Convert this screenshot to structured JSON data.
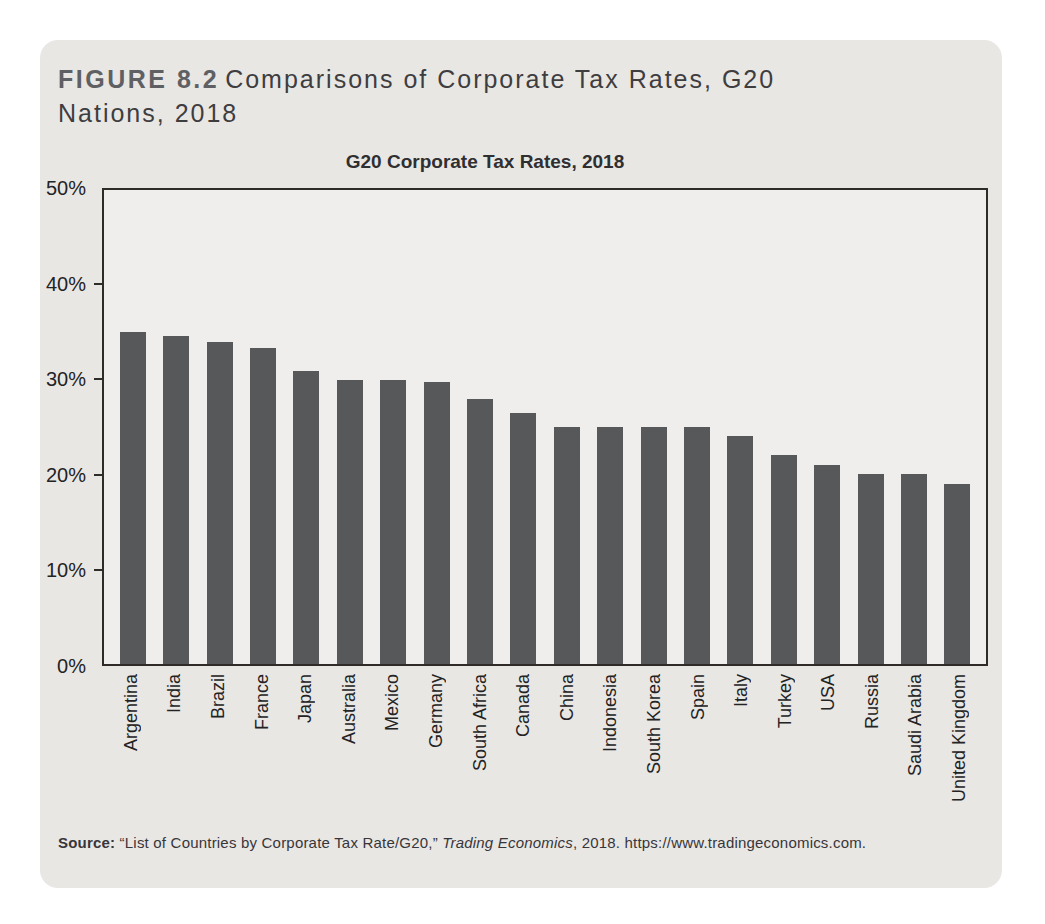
{
  "figure": {
    "label": "FIGURE 8.2",
    "title": "Comparisons of Corporate Tax Rates, G20 Nations, 2018"
  },
  "chart_data": {
    "type": "bar",
    "title": "G20 Corporate Tax Rates, 2018",
    "categories": [
      "Argentina",
      "India",
      "Brazil",
      "France",
      "Japan",
      "Australia",
      "Mexico",
      "Germany",
      "South Africa",
      "Canada",
      "China",
      "Indonesia",
      "South Korea",
      "Spain",
      "Italy",
      "Turkey",
      "USA",
      "Russia",
      "Saudi Arabia",
      "United Kingdom"
    ],
    "values": [
      35,
      34.6,
      34,
      33.3,
      30.9,
      30,
      30,
      29.8,
      28,
      26.5,
      25,
      25,
      25,
      25,
      24,
      22,
      21,
      20,
      20,
      19
    ],
    "xlabel": "",
    "ylabel": "",
    "ylim": [
      0,
      50
    ],
    "yticks": [
      0,
      10,
      20,
      30,
      40,
      50
    ],
    "ytick_labels": [
      "0%",
      "10%",
      "20%",
      "30%",
      "40%",
      "50%"
    ],
    "bar_color": "#57585a",
    "grid": false,
    "legend": null
  },
  "source": {
    "label": "Source:",
    "before_italic": " “List of Countries by Corporate Tax Rate/G20,” ",
    "italic": "Trading Economics",
    "after_italic": ", 2018. https://www.tradingeconomics.com."
  },
  "colors": {
    "card_bg": "#e9e7e4",
    "plot_bg": "#efeeec",
    "bar": "#57585a",
    "axis": "#2e2b28",
    "figure_label": "#5f6063",
    "text": "#3e3d3f"
  }
}
